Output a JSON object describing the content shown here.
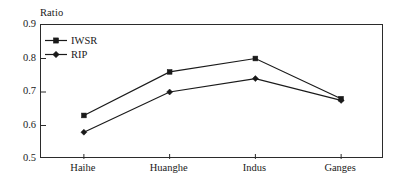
{
  "chart_data": {
    "type": "line",
    "title": "",
    "ylabel": "Ratio",
    "xlabel": "",
    "categories": [
      "Haihe",
      "Huanghe",
      "Indus",
      "Ganges"
    ],
    "series": [
      {
        "name": "IWSR",
        "marker": "square",
        "values": [
          0.63,
          0.76,
          0.8,
          0.68
        ]
      },
      {
        "name": "RIP",
        "marker": "diamond",
        "values": [
          0.58,
          0.7,
          0.74,
          0.675
        ]
      }
    ],
    "ylim": [
      0.5,
      0.9
    ],
    "yticks": [
      "0.5",
      "0.6",
      "0.7",
      "0.8",
      "0.9"
    ],
    "ytick_values": [
      0.5,
      0.6,
      0.7,
      0.8,
      0.9
    ],
    "grid": false,
    "legend_position": "top-left-inside",
    "line_color": "#1a1a1a",
    "frame_color": "#2b2b2b"
  }
}
